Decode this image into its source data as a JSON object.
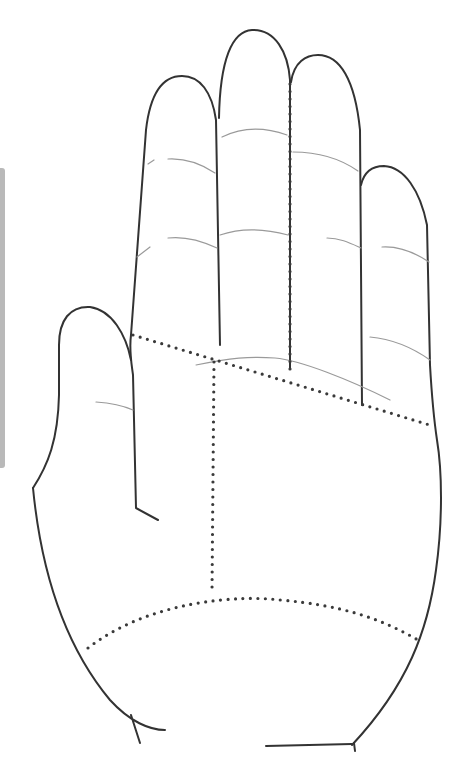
{
  "diagram": {
    "colors": {
      "outline": "#333333",
      "crease": "#9a9a9a",
      "dotted_divider": "#3a3a3a",
      "side_tab": "#b9b9b9",
      "background": "#ffffff"
    },
    "parts": [
      "thumb",
      "index-finger",
      "middle-finger",
      "ring-finger",
      "little-finger",
      "palm"
    ],
    "dividers": [
      "finger-base-line",
      "center-vertical-line",
      "middle-ring-vertical-line",
      "wrist-arc-line"
    ]
  }
}
